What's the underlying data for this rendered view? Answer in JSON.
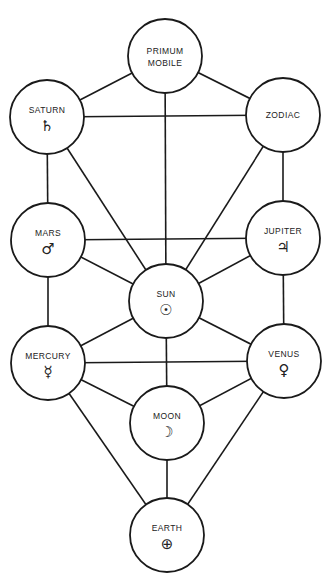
{
  "diagram": {
    "title": "",
    "nodes": [
      {
        "id": "primum-mobile",
        "label_lines": [
          "PRIMUM",
          "MOBILE"
        ],
        "symbol": "",
        "symbol_name": ""
      },
      {
        "id": "saturn",
        "label_lines": [
          "SATURN"
        ],
        "symbol": "♄",
        "symbol_name": "saturn-icon"
      },
      {
        "id": "zodiac",
        "label_lines": [
          "ZODIAC"
        ],
        "symbol": "",
        "symbol_name": ""
      },
      {
        "id": "mars",
        "label_lines": [
          "MARS"
        ],
        "symbol": "♂",
        "symbol_name": "mars-icon"
      },
      {
        "id": "jupiter",
        "label_lines": [
          "JUPITER"
        ],
        "symbol": "♃",
        "symbol_name": "jupiter-icon"
      },
      {
        "id": "sun",
        "label_lines": [
          "SUN"
        ],
        "symbol": "☉",
        "symbol_name": "sun-icon"
      },
      {
        "id": "mercury",
        "label_lines": [
          "MERCURY"
        ],
        "symbol": "☿",
        "symbol_name": "mercury-icon"
      },
      {
        "id": "venus",
        "label_lines": [
          "VENUS"
        ],
        "symbol": "♀",
        "symbol_name": "venus-icon"
      },
      {
        "id": "moon",
        "label_lines": [
          "MOON"
        ],
        "symbol": "☽",
        "symbol_name": "moon-icon"
      },
      {
        "id": "earth",
        "label_lines": [
          "EARTH"
        ],
        "symbol": "⊕",
        "symbol_name": "earth-icon"
      }
    ],
    "edges": [
      [
        "primum-mobile",
        "saturn"
      ],
      [
        "primum-mobile",
        "zodiac"
      ],
      [
        "primum-mobile",
        "sun"
      ],
      [
        "saturn",
        "zodiac"
      ],
      [
        "saturn",
        "mars"
      ],
      [
        "saturn",
        "sun"
      ],
      [
        "zodiac",
        "jupiter"
      ],
      [
        "zodiac",
        "sun"
      ],
      [
        "mars",
        "jupiter"
      ],
      [
        "mars",
        "sun"
      ],
      [
        "mars",
        "mercury"
      ],
      [
        "jupiter",
        "sun"
      ],
      [
        "jupiter",
        "venus"
      ],
      [
        "sun",
        "mercury"
      ],
      [
        "sun",
        "venus"
      ],
      [
        "sun",
        "moon"
      ],
      [
        "mercury",
        "venus"
      ],
      [
        "mercury",
        "moon"
      ],
      [
        "mercury",
        "earth"
      ],
      [
        "venus",
        "moon"
      ],
      [
        "venus",
        "earth"
      ],
      [
        "moon",
        "earth"
      ]
    ]
  }
}
